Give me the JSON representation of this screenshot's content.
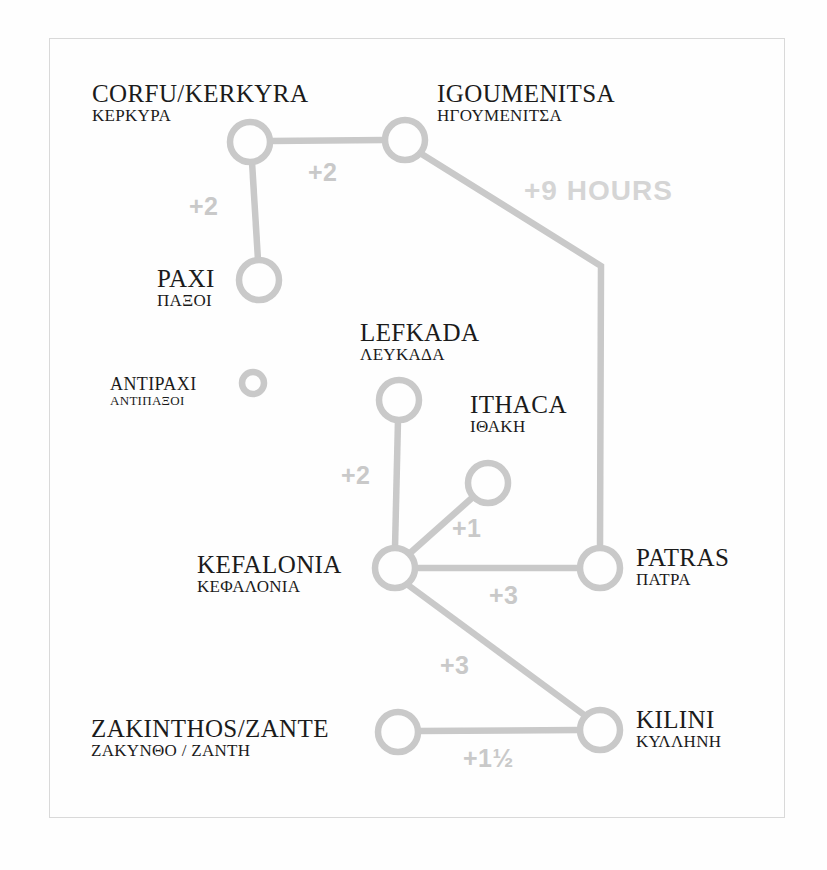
{
  "diagram": {
    "title_type": "ferry-route-time-diagram",
    "colors": {
      "line": "#c9c9c9",
      "node_stroke": "#c9c9c9",
      "label_text": "#1b1b1b",
      "duration_text": "#c9c9c9",
      "frame_border": "#d9d9d9",
      "background": "#fefefe"
    },
    "nodes": [
      {
        "id": "corfu",
        "en": "CORFU/KERKYRA",
        "gr": "ΚΕΡΚΥΡΑ",
        "cx": 250,
        "cy": 142,
        "r": 20
      },
      {
        "id": "igoumenitsa",
        "en": "IGOUMENITSA",
        "gr": "ΗΓΟΥΜΕΝΙΤΣΑ",
        "cx": 405,
        "cy": 140,
        "r": 20
      },
      {
        "id": "paxi",
        "en": "PAXI",
        "gr": "ΠΑΞΟΙ",
        "cx": 259,
        "cy": 280,
        "r": 20
      },
      {
        "id": "antipaxi",
        "en": "ANTIPAXI",
        "gr": "ΑΝΤΙΠΑΞΟΙ",
        "cx": 253,
        "cy": 383,
        "r": 12
      },
      {
        "id": "lefkada",
        "en": "LEFKADA",
        "gr": "ΛΕΥΚΑΔΑ",
        "cx": 399,
        "cy": 400,
        "r": 20
      },
      {
        "id": "ithaca",
        "en": "ITHACA",
        "gr": "ΙΘΑΚΗ",
        "cx": 488,
        "cy": 483,
        "r": 20
      },
      {
        "id": "kefalonia",
        "en": "KEFALONIA",
        "gr": "ΚΕΦΑΛΟΝΙΑ",
        "cx": 395,
        "cy": 568,
        "r": 20
      },
      {
        "id": "patras",
        "en": "PATRAS",
        "gr": "ΠΑΤΡΑ",
        "cx": 600,
        "cy": 568,
        "r": 20
      },
      {
        "id": "zakinthos",
        "en": "ZAKINTHOS/ZANTE",
        "gr": "ΖΑΚΥΝΘΟ / ΖΑΝΤΗ",
        "cx": 398,
        "cy": 732,
        "r": 20
      },
      {
        "id": "kilini",
        "en": "KILINI",
        "gr": "ΚΥΛΛΗΝΗ",
        "cx": 600,
        "cy": 730,
        "r": 20
      }
    ],
    "edges": [
      {
        "id": "corfu-igoumenitsa",
        "from": "corfu",
        "to": "igoumenitsa",
        "duration": "+2"
      },
      {
        "id": "corfu-paxi",
        "from": "corfu",
        "to": "paxi",
        "duration": "+2"
      },
      {
        "id": "igoumenitsa-patras",
        "from": "igoumenitsa",
        "to": "patras",
        "duration": "+9 HOURS"
      },
      {
        "id": "lefkada-kefalonia",
        "from": "lefkada",
        "to": "kefalonia",
        "duration": "+2"
      },
      {
        "id": "ithaca-kefalonia",
        "from": "ithaca",
        "to": "kefalonia",
        "duration": "+1"
      },
      {
        "id": "kefalonia-patras",
        "from": "kefalonia",
        "to": "patras",
        "duration": "+3"
      },
      {
        "id": "kefalonia-kilini",
        "from": "kefalonia",
        "to": "kilini",
        "duration": "+3"
      },
      {
        "id": "zakinthos-kilini",
        "from": "zakinthos",
        "to": "kilini",
        "duration": "+1½"
      }
    ],
    "labels": {
      "corfu_en": "CORFU/KERKYRA",
      "corfu_gr": "ΚΕΡΚΥΡΑ",
      "igoumenitsa_en": "IGOUMENITSA",
      "igoumenitsa_gr": "ΗΓΟΥΜΕΝΙΤΣΑ",
      "paxi_en": "PAXI",
      "paxi_gr": "ΠΑΞΟΙ",
      "antipaxi_en": "ANTIPAXI",
      "antipaxi_gr": "ΑΝΤΙΠΑΞΟΙ",
      "lefkada_en": "LEFKADA",
      "lefkada_gr": "ΛΕΥΚΑΔΑ",
      "ithaca_en": "ITHACA",
      "ithaca_gr": "ΙΘΑΚΗ",
      "kefalonia_en": "KEFALONIA",
      "kefalonia_gr": "ΚΕΦΑΛΟΝΙΑ",
      "patras_en": "PATRAS",
      "patras_gr": "ΠΑΤΡΑ",
      "zakinthos_en": "ZAKINTHOS/ZANTE",
      "zakinthos_gr": "ΖΑΚΥΝΘΟ / ΖΑΝΤΗ",
      "kilini_en": "KILINI",
      "kilini_gr": "ΚΥΛΛΗΝΗ"
    },
    "durations": {
      "corfu_igoumenitsa": "+2",
      "corfu_paxi": "+2",
      "igoumenitsa_patras": "+9 HOURS",
      "lefkada_kefalonia": "+2",
      "ithaca_kefalonia": "+1",
      "kefalonia_patras": "+3",
      "kefalonia_kilini": "+3",
      "zakinthos_kilini": "+1½"
    }
  }
}
